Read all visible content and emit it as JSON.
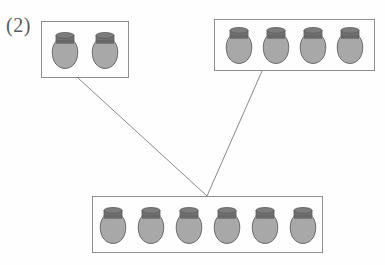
{
  "diagram": {
    "label": "(2)",
    "type": "part-part-whole-jar-grouping",
    "background_color": "#fefefe",
    "box_border_color": "#8e8e8e",
    "connector_color": "#8a8a8a",
    "jar_body_color": "#a8a8a8",
    "jar_lid_color": "#707070",
    "jar_outline_color": "#5e5e5e",
    "groups": [
      {
        "name": "top-left-group",
        "jar_count": 2,
        "x": 41,
        "y": 21,
        "width": 88,
        "height": 57,
        "jar_width": 30,
        "jar_height": 40,
        "jar_gap": 10
      },
      {
        "name": "top-right-group",
        "jar_count": 4,
        "x": 214,
        "y": 19,
        "width": 161,
        "height": 52,
        "jar_width": 30,
        "jar_height": 40,
        "jar_gap": 7
      },
      {
        "name": "bottom-whole-group",
        "jar_count": 6,
        "x": 92,
        "y": 196,
        "width": 231,
        "height": 57,
        "jar_width": 30,
        "jar_height": 40,
        "jar_gap": 8
      }
    ],
    "connectors": [
      {
        "name": "left-connector",
        "x1": 78,
        "y1": 78,
        "x2": 207,
        "y2": 196
      },
      {
        "name": "right-connector",
        "x1": 262,
        "y1": 71,
        "x2": 207,
        "y2": 196
      }
    ]
  },
  "chart_data": {
    "type": "bar",
    "title": "(2)",
    "categories": [
      "Group A",
      "Group B",
      "Total"
    ],
    "values": [
      2,
      4,
      6
    ],
    "xlabel": "",
    "ylabel": "Number of jars",
    "ylim": [
      0,
      6
    ]
  }
}
